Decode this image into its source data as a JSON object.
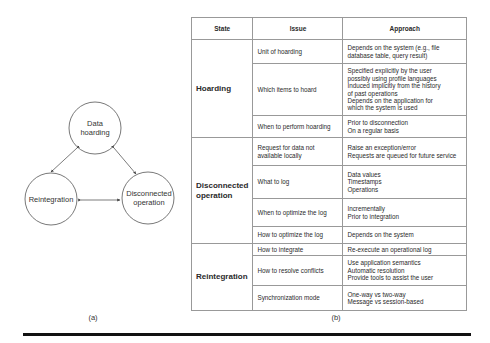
{
  "diagram": {
    "nodes": [
      {
        "id": "data-hoarding",
        "label_lines": [
          "Data",
          "hoarding"
        ]
      },
      {
        "id": "reintegration",
        "label_lines": [
          "Reintegration"
        ]
      },
      {
        "id": "disconnected-operation",
        "label_lines": [
          "Disconnected",
          "operation"
        ]
      }
    ],
    "edges": [
      {
        "from": "data-hoarding",
        "to": "reintegration",
        "bidirectional": true
      },
      {
        "from": "data-hoarding",
        "to": "disconnected-operation",
        "bidirectional": true
      },
      {
        "from": "reintegration",
        "to": "disconnected-operation",
        "bidirectional": true
      }
    ],
    "caption": "(a)"
  },
  "table": {
    "headers": [
      "State",
      "Issue",
      "Approach"
    ],
    "groups": [
      {
        "state_lines": [
          "Hoarding"
        ],
        "rows": [
          {
            "issue": "Unit of hoarding",
            "approach": [
              "Depends on the system (e.g., file",
              "database table, query result)"
            ]
          },
          {
            "issue": "Which items to hoard",
            "approach": [
              "Specified explicitly by the user",
              "possibly using profile languages",
              "Induced implicitly from the history",
              "of past operations",
              "Depends on the application for",
              "which the system is used"
            ]
          },
          {
            "issue": "When to perform hoarding",
            "approach": [
              "Prior to disconnection",
              "On a regular basis"
            ]
          }
        ]
      },
      {
        "state_lines": [
          "Disconnected",
          "operation"
        ],
        "rows": [
          {
            "issue_lines": [
              "Request for data not",
              "available locally"
            ],
            "approach": [
              "Raise an exception/error",
              "Requests are queued for future service"
            ]
          },
          {
            "issue": "What to log",
            "approach": [
              "Data values",
              "Timestamps",
              "Operations"
            ]
          },
          {
            "issue": "When to optimize the log",
            "approach": [
              "Incrementally",
              "Prior to integration"
            ]
          },
          {
            "issue": "How to optimize the log",
            "approach": [
              "Depends on the system"
            ]
          }
        ]
      },
      {
        "state_lines": [
          "Reintegration"
        ],
        "rows": [
          {
            "issue": "How to integrate",
            "approach": [
              "Re-execute an operational log"
            ]
          },
          {
            "issue": "How to resolve conflicts",
            "approach": [
              "Use application semantics",
              "Automatic resolution",
              "Provide tools to assist the user"
            ]
          },
          {
            "issue": "Synchronization mode",
            "approach": [
              "One-way vs two-way",
              "Message vs session-based"
            ]
          }
        ]
      }
    ],
    "caption": "(b)"
  }
}
